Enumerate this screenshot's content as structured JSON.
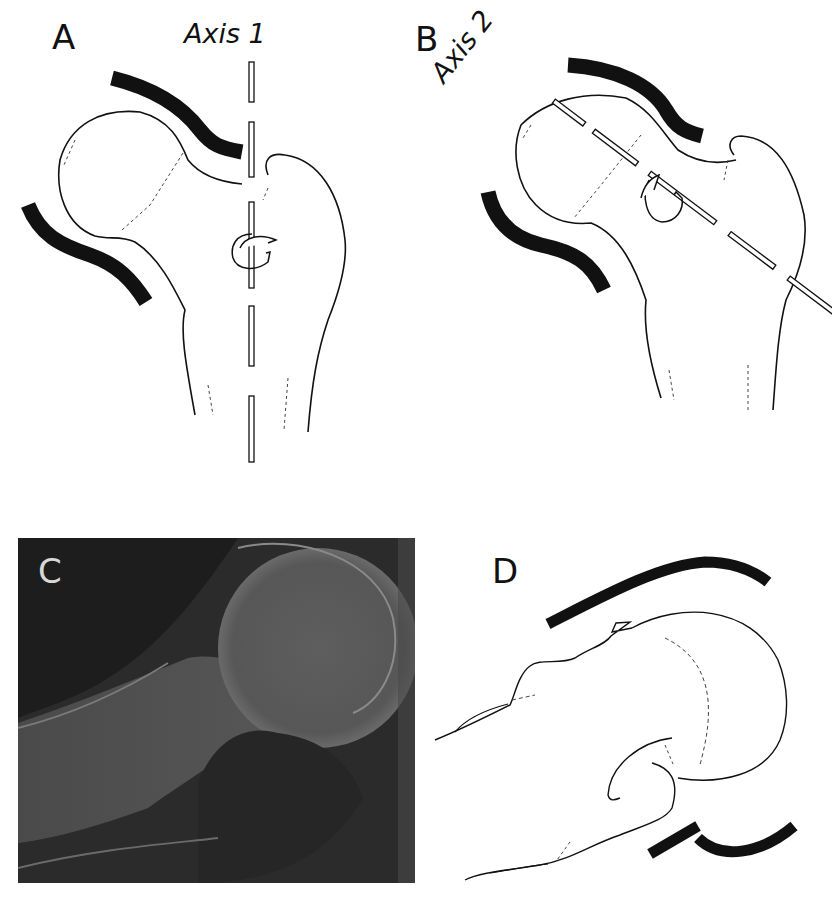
{
  "figure": {
    "panels": [
      {
        "id": "A",
        "label": "A",
        "axis_label": "Axis 1",
        "content": "Femoral head in acetabulum, vertical axis with rotation arrow"
      },
      {
        "id": "B",
        "label": "B",
        "axis_label": "Axis 2",
        "content": "Femoral head in acetabulum, oblique axis along femoral neck with rotation arrow"
      },
      {
        "id": "C",
        "label": "C",
        "content": "Radiograph of hip joint"
      },
      {
        "id": "D",
        "label": "D",
        "content": "Line tracing of radiograph with acetabular margins"
      }
    ],
    "colors": {
      "ink": "#111111",
      "background": "#ffffff",
      "xray_dark": "#2a2a2a",
      "xray_bone": "#6b6b6b"
    }
  }
}
